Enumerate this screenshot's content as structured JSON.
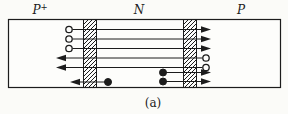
{
  "figure": {
    "caption": "(a)",
    "regions": [
      {
        "name": "emitter",
        "base": "P",
        "sup": "+",
        "label_x": 40
      },
      {
        "name": "base",
        "base": "N",
        "sup": "",
        "label_x": 139
      },
      {
        "name": "collector",
        "base": "P",
        "sup": "",
        "label_x": 241
      }
    ]
  },
  "diagram": {
    "ink": "#1c1c1c",
    "paper": "#fdfdfb",
    "body": {
      "x": 8.5,
      "y": 19.5,
      "w": 272,
      "h": 68
    },
    "junctions": [
      {
        "name": "emitter-base-junction",
        "x": 83.5,
        "w": 13
      },
      {
        "name": "base-collector-junction",
        "x": 183.5,
        "w": 13
      }
    ],
    "flows": [
      {
        "carrier": "hole",
        "direction": "right",
        "y": 29.5,
        "marker_x": 69,
        "line_from": 72.5,
        "line_to": 201,
        "tip_x": 211
      },
      {
        "carrier": "hole",
        "direction": "right",
        "y": 39,
        "marker_x": 69,
        "line_from": 72.5,
        "line_to": 201,
        "tip_x": 211
      },
      {
        "carrier": "hole",
        "direction": "right",
        "y": 48.5,
        "marker_x": 69,
        "line_from": 72.5,
        "line_to": 201,
        "tip_x": 211
      },
      {
        "carrier": "hole",
        "direction": "left",
        "y": 58,
        "marker_x": 206,
        "line_from": 202.5,
        "line_to": 66,
        "tip_x": 56
      },
      {
        "carrier": "hole",
        "direction": "left",
        "y": 67.5,
        "marker_x": 206,
        "line_from": 202.5,
        "line_to": 66,
        "tip_x": 56
      },
      {
        "carrier": "electron",
        "direction": "left",
        "y": 82,
        "marker_x": 108,
        "line_from": 108,
        "line_to": 80,
        "tip_x": 70
      },
      {
        "carrier": "electron",
        "direction": "right",
        "y": 72.5,
        "marker_x": 163,
        "line_from": 163,
        "line_to": 201,
        "tip_x": 211
      },
      {
        "carrier": "electron",
        "direction": "right",
        "y": 81.5,
        "marker_x": 163,
        "line_from": 163,
        "line_to": 201,
        "tip_x": 211
      }
    ]
  }
}
